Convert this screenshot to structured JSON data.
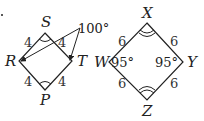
{
  "figure_left": {
    "shape": "rhombus",
    "vertices": {
      "S": "S",
      "R": "R",
      "T": "T",
      "P": "P"
    },
    "side_labels": [
      "4",
      "4",
      "4",
      "4"
    ],
    "angle_annotation": "100°",
    "angle_marks": [
      "S",
      "P"
    ]
  },
  "figure_right": {
    "shape": "rhombus",
    "vertices": {
      "X": "X",
      "W": "W",
      "Y": "Y",
      "Z": "Z"
    },
    "side_labels": [
      "6",
      "6",
      "6",
      "6"
    ],
    "angle_W": "95°",
    "angle_Y": "95°",
    "angle_marks": [
      "X",
      "Z"
    ]
  },
  "colors": {
    "stroke": "#222222",
    "text": "#222222"
  }
}
